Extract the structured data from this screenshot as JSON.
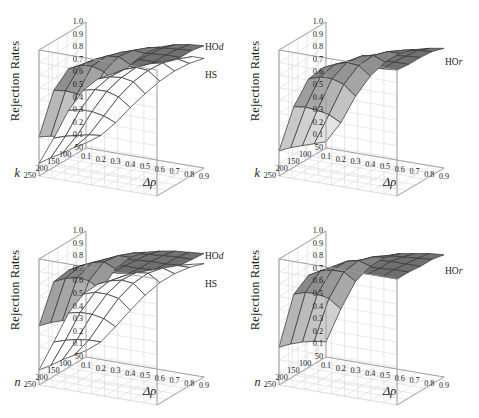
{
  "figure": {
    "panels": [
      {
        "id": "top-left",
        "ylabel": "Rejection Rates",
        "xlabel": "Δρ",
        "depth_axis": "k",
        "zticks": [
          "1.0",
          "0.9",
          "0.8",
          "0.7",
          "0.6",
          "0.5",
          "0.4",
          "0.3",
          "0.2",
          "0.1"
        ],
        "dticks": [
          "250",
          "200",
          "150",
          "100",
          "50"
        ],
        "xticks": [
          "0.1",
          "0.2",
          "0.3",
          "0.4",
          "0.5",
          "0.6",
          "0.7",
          "0.8",
          "0.9"
        ],
        "surface_labels": [
          {
            "text": "HO",
            "italic": "d"
          },
          {
            "text": "HS",
            "italic": ""
          }
        ]
      },
      {
        "id": "top-right",
        "ylabel": "Rejection Rates",
        "xlabel": "Δρ",
        "depth_axis": "k",
        "zticks": [
          "1.0",
          "0.9",
          "0.8",
          "0.7",
          "0.6",
          "0.5",
          "0.4",
          "0.3",
          "0.2",
          "0.1"
        ],
        "dticks": [
          "250",
          "200",
          "150",
          "100",
          "50"
        ],
        "xticks": [
          "0.1",
          "0.2",
          "0.3",
          "0.4",
          "0.5",
          "0.6",
          "0.7",
          "0.8",
          "0.9"
        ],
        "surface_labels": [
          {
            "text": "HO",
            "italic": "r"
          }
        ]
      },
      {
        "id": "bottom-left",
        "ylabel": "Rejection Rates",
        "xlabel": "Δρ",
        "depth_axis": "n",
        "zticks": [
          "1.0",
          "0.9",
          "0.8",
          "0.7",
          "0.6",
          "0.5",
          "0.4",
          "0.3",
          "0.2",
          "0.1"
        ],
        "dticks": [
          "250",
          "200",
          "150",
          "100",
          "50"
        ],
        "xticks": [
          "0.1",
          "0.2",
          "0.3",
          "0.4",
          "0.5",
          "0.6",
          "0.7",
          "0.8",
          "0.9"
        ],
        "surface_labels": [
          {
            "text": "HO",
            "italic": "d"
          },
          {
            "text": "HS",
            "italic": ""
          }
        ]
      },
      {
        "id": "bottom-right",
        "ylabel": "Rejection Rates",
        "xlabel": "Δρ",
        "depth_axis": "n",
        "zticks": [
          "1.0",
          "0.9",
          "0.8",
          "0.7",
          "0.6",
          "0.5",
          "0.4",
          "0.3",
          "0.2",
          "0.1"
        ],
        "dticks": [
          "250",
          "200",
          "150",
          "100",
          "50"
        ],
        "xticks": [
          "0.1",
          "0.2",
          "0.3",
          "0.4",
          "0.5",
          "0.6",
          "0.7",
          "0.8",
          "0.9"
        ],
        "surface_labels": [
          {
            "text": "HO",
            "italic": "r"
          }
        ]
      }
    ]
  },
  "colors": {
    "grid": "#d8d8d8",
    "axis": "#9a9a9a",
    "mesh": "#3a3a3a",
    "background": "#ffffff",
    "surface_light": "#f2f2f2",
    "surface_mid": "#b8b8b8",
    "surface_dark": "#6e6e6e"
  },
  "chart_data": [
    {
      "type": "surface",
      "panel": "top-left",
      "title": "",
      "xlabel": "Δρ",
      "ylabel": "k",
      "zlabel": "Rejection Rates",
      "xlim": [
        0.1,
        0.9
      ],
      "ylim": [
        50,
        250
      ],
      "zlim": [
        0.0,
        1.0
      ],
      "grid": true,
      "x": [
        0.1,
        0.2,
        0.3,
        0.4,
        0.5,
        0.6,
        0.7,
        0.8,
        0.9
      ],
      "y": [
        50,
        100,
        150,
        200,
        250
      ],
      "series": [
        {
          "name": "HOd",
          "z": [
            [
              0.08,
              0.3,
              0.55,
              0.72,
              0.83,
              0.9,
              0.94,
              0.96,
              0.97
            ],
            [
              0.14,
              0.45,
              0.7,
              0.84,
              0.91,
              0.95,
              0.97,
              0.98,
              0.99
            ],
            [
              0.2,
              0.56,
              0.8,
              0.9,
              0.95,
              0.97,
              0.98,
              0.99,
              0.99
            ],
            [
              0.26,
              0.64,
              0.86,
              0.93,
              0.97,
              0.98,
              0.99,
              0.99,
              1.0
            ],
            [
              0.31,
              0.7,
              0.89,
              0.95,
              0.98,
              0.99,
              0.99,
              1.0,
              1.0
            ]
          ]
        },
        {
          "name": "HS",
          "z": [
            [
              0.04,
              0.12,
              0.24,
              0.38,
              0.51,
              0.63,
              0.73,
              0.81,
              0.87
            ],
            [
              0.06,
              0.18,
              0.35,
              0.52,
              0.66,
              0.77,
              0.85,
              0.9,
              0.94
            ],
            [
              0.07,
              0.23,
              0.44,
              0.62,
              0.75,
              0.85,
              0.9,
              0.94,
              0.96
            ],
            [
              0.09,
              0.28,
              0.51,
              0.69,
              0.81,
              0.89,
              0.93,
              0.96,
              0.97
            ],
            [
              0.1,
              0.32,
              0.56,
              0.74,
              0.85,
              0.91,
              0.95,
              0.97,
              0.98
            ]
          ]
        }
      ]
    },
    {
      "type": "surface",
      "panel": "top-right",
      "title": "",
      "xlabel": "Δρ",
      "ylabel": "k",
      "zlabel": "Rejection Rates",
      "xlim": [
        0.1,
        0.9
      ],
      "ylim": [
        50,
        250
      ],
      "zlim": [
        0.0,
        1.0
      ],
      "grid": true,
      "x": [
        0.1,
        0.2,
        0.3,
        0.4,
        0.5,
        0.6,
        0.7,
        0.8,
        0.9
      ],
      "y": [
        50,
        100,
        150,
        200,
        250
      ],
      "series": [
        {
          "name": "HOr",
          "z": [
            [
              0.05,
              0.22,
              0.45,
              0.63,
              0.76,
              0.85,
              0.9,
              0.93,
              0.95
            ],
            [
              0.09,
              0.34,
              0.6,
              0.77,
              0.87,
              0.92,
              0.95,
              0.97,
              0.98
            ],
            [
              0.13,
              0.43,
              0.7,
              0.85,
              0.92,
              0.95,
              0.97,
              0.98,
              0.99
            ],
            [
              0.17,
              0.51,
              0.77,
              0.89,
              0.94,
              0.97,
              0.98,
              0.99,
              0.99
            ],
            [
              0.2,
              0.57,
              0.81,
              0.92,
              0.96,
              0.98,
              0.99,
              0.99,
              1.0
            ]
          ]
        }
      ]
    },
    {
      "type": "surface",
      "panel": "bottom-left",
      "title": "",
      "xlabel": "Δρ",
      "ylabel": "n",
      "zlabel": "Rejection Rates",
      "xlim": [
        0.1,
        0.9
      ],
      "ylim": [
        50,
        250
      ],
      "zlim": [
        0.0,
        1.0
      ],
      "grid": true,
      "x": [
        0.1,
        0.2,
        0.3,
        0.4,
        0.5,
        0.6,
        0.7,
        0.8,
        0.9
      ],
      "y": [
        50,
        100,
        150,
        200,
        250
      ],
      "series": [
        {
          "name": "HOd",
          "z": [
            [
              0.26,
              0.55,
              0.74,
              0.85,
              0.91,
              0.94,
              0.96,
              0.97,
              0.98
            ],
            [
              0.34,
              0.68,
              0.85,
              0.92,
              0.96,
              0.97,
              0.98,
              0.99,
              0.99
            ],
            [
              0.4,
              0.76,
              0.9,
              0.95,
              0.97,
              0.98,
              0.99,
              0.99,
              1.0
            ],
            [
              0.44,
              0.81,
              0.93,
              0.97,
              0.98,
              0.99,
              0.99,
              1.0,
              1.0
            ],
            [
              0.47,
              0.84,
              0.95,
              0.98,
              0.99,
              0.99,
              1.0,
              1.0,
              1.0
            ]
          ]
        },
        {
          "name": "HS",
          "z": [
            [
              0.05,
              0.14,
              0.28,
              0.43,
              0.57,
              0.69,
              0.78,
              0.85,
              0.9
            ],
            [
              0.07,
              0.21,
              0.4,
              0.58,
              0.72,
              0.82,
              0.88,
              0.92,
              0.95
            ],
            [
              0.09,
              0.27,
              0.49,
              0.67,
              0.8,
              0.88,
              0.92,
              0.95,
              0.97
            ],
            [
              0.1,
              0.32,
              0.56,
              0.74,
              0.85,
              0.91,
              0.95,
              0.97,
              0.98
            ],
            [
              0.12,
              0.36,
              0.61,
              0.78,
              0.88,
              0.93,
              0.96,
              0.98,
              0.99
            ]
          ]
        }
      ]
    },
    {
      "type": "surface",
      "panel": "bottom-right",
      "title": "",
      "xlabel": "Δρ",
      "ylabel": "n",
      "zlabel": "Rejection Rates",
      "xlim": [
        0.1,
        0.9
      ],
      "ylim": [
        50,
        250
      ],
      "zlim": [
        0.0,
        1.0
      ],
      "grid": true,
      "x": [
        0.1,
        0.2,
        0.3,
        0.4,
        0.5,
        0.6,
        0.7,
        0.8,
        0.9
      ],
      "y": [
        50,
        100,
        150,
        200,
        250
      ],
      "series": [
        {
          "name": "HOr",
          "z": [
            [
              0.12,
              0.4,
              0.64,
              0.78,
              0.87,
              0.92,
              0.94,
              0.96,
              0.97
            ],
            [
              0.18,
              0.54,
              0.77,
              0.88,
              0.93,
              0.96,
              0.97,
              0.98,
              0.99
            ],
            [
              0.23,
              0.63,
              0.84,
              0.93,
              0.96,
              0.98,
              0.99,
              0.99,
              0.99
            ],
            [
              0.27,
              0.7,
              0.89,
              0.95,
              0.98,
              0.99,
              0.99,
              1.0,
              1.0
            ],
            [
              0.3,
              0.74,
              0.91,
              0.96,
              0.98,
              0.99,
              1.0,
              1.0,
              1.0
            ]
          ]
        }
      ]
    }
  ]
}
